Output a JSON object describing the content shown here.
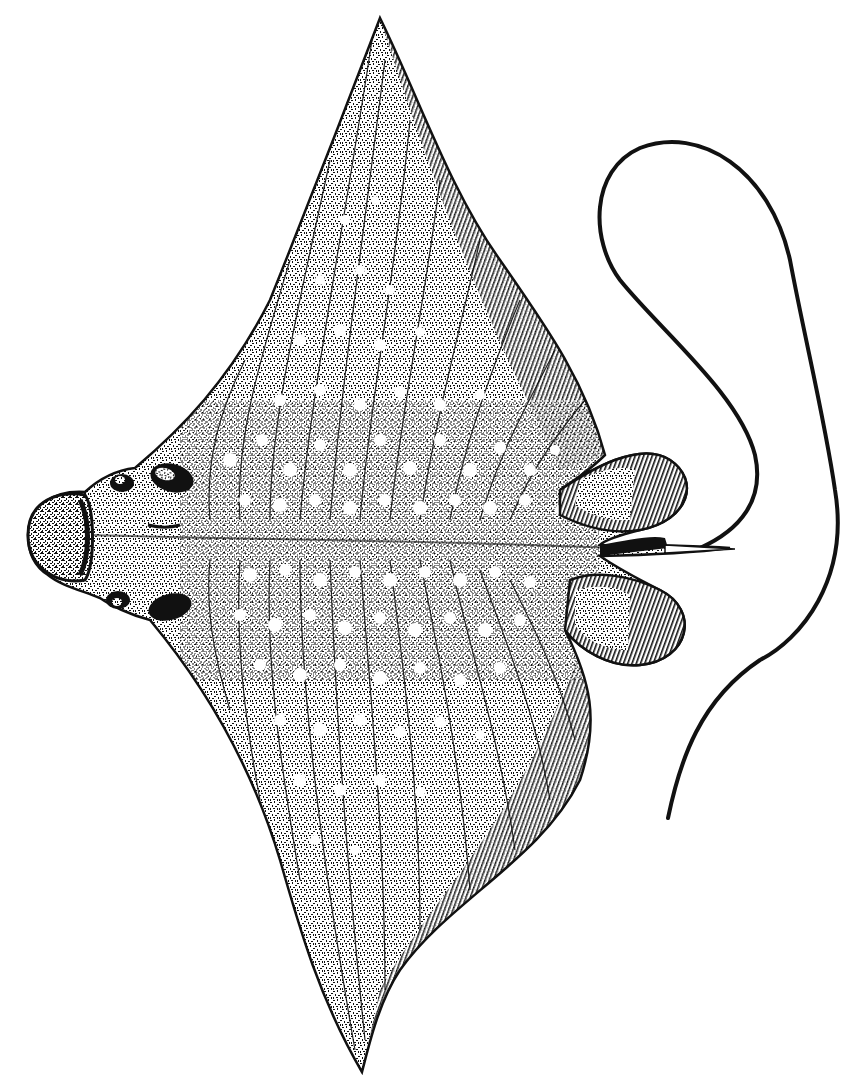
{
  "image": {
    "subject": "Spotted eagle ray, dorsal view",
    "style": "black-and-white stippled pen illustration",
    "width": 857,
    "height": 1088,
    "colors": {
      "background": "#ffffff",
      "ink": "#111111",
      "spot": "#ffffff"
    }
  },
  "figure": {
    "parts": [
      {
        "id": "head",
        "label": "Head with rounded snout"
      },
      {
        "id": "eyes",
        "label": "Pair of dark eyes / spiracles"
      },
      {
        "id": "upper-pectoral-fin",
        "label": "Upper pectoral fin (wing)"
      },
      {
        "id": "lower-pectoral-fin",
        "label": "Lower pectoral fin (wing)"
      },
      {
        "id": "pelvic-fins",
        "label": "Pair of pelvic fins"
      },
      {
        "id": "dorsal-fin-spine",
        "label": "Small dorsal fin and spine"
      },
      {
        "id": "tail",
        "label": "Long whip-like tail"
      }
    ]
  }
}
